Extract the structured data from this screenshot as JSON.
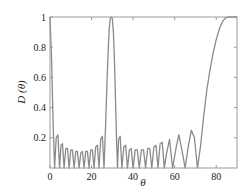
{
  "chart_data": {
    "type": "line",
    "title": "",
    "xlabel": "θ",
    "ylabel": "D (θ)",
    "xlim": [
      0,
      90
    ],
    "ylim": [
      0,
      1
    ],
    "x_ticks": [
      0,
      20,
      40,
      60,
      80
    ],
    "y_ticks": [
      0.2,
      0.4,
      0.6,
      0.8,
      1
    ],
    "y_tick_labels": [
      "0.2",
      "0.4",
      "0.6",
      "0.8",
      "1"
    ],
    "x_tick_labels": [
      "0",
      "20",
      "40",
      "60",
      "80"
    ],
    "grid": false,
    "legend": null,
    "line_color": "#8a8a8a",
    "series": [
      {
        "name": "D(θ)",
        "x": [
          0,
          0.8,
          1.5,
          2.2,
          3.0,
          3.8,
          4.6,
          5.3,
          6.0,
          6.8,
          7.6,
          8.4,
          9.2,
          10.0,
          10.8,
          11.6,
          12.4,
          13.2,
          14.0,
          14.8,
          15.6,
          16.4,
          17.2,
          18.0,
          18.8,
          19.6,
          20.4,
          21.2,
          22.0,
          22.8,
          23.6,
          24.4,
          25.2,
          26.0,
          26.8,
          27.4,
          28.0,
          28.5,
          29.0,
          29.5,
          30.0,
          30.5,
          31.0,
          31.5,
          32.0,
          32.5,
          33.0,
          33.8,
          34.6,
          35.5,
          36.4,
          37.3,
          38.2,
          39.1,
          40.0,
          41.0,
          42.0,
          43.0,
          44.0,
          45.0,
          46.0,
          47.0,
          48.0,
          49.0,
          50.0,
          51.0,
          52.0,
          53.0,
          54.0,
          55.0,
          56.0,
          57.5,
          59.0,
          60.5,
          62.0,
          63.5,
          65.0,
          66.5,
          68.0,
          69.5,
          71.0,
          72.5,
          74.0,
          75.5,
          77.0,
          78.5,
          80.0,
          81.5,
          83.0,
          84.5,
          86.0,
          88.0,
          90.0
        ],
        "y": [
          1.0,
          0.7,
          0.3,
          0.0,
          0.2,
          0.22,
          0.0,
          0.15,
          0.16,
          0.0,
          0.13,
          0.13,
          0.0,
          0.12,
          0.12,
          0.0,
          0.11,
          0.11,
          0.0,
          0.1,
          0.11,
          0.0,
          0.11,
          0.11,
          0.0,
          0.12,
          0.12,
          0.0,
          0.14,
          0.15,
          0.0,
          0.19,
          0.21,
          0.0,
          0.3,
          0.55,
          0.78,
          0.92,
          0.99,
          1.0,
          0.99,
          0.9,
          0.72,
          0.45,
          0.2,
          0.0,
          0.19,
          0.21,
          0.0,
          0.14,
          0.15,
          0.0,
          0.12,
          0.13,
          0.0,
          0.12,
          0.12,
          0.0,
          0.12,
          0.12,
          0.0,
          0.13,
          0.13,
          0.0,
          0.14,
          0.15,
          0.0,
          0.16,
          0.17,
          0.0,
          0.09,
          0.19,
          0.0,
          0.12,
          0.22,
          0.12,
          0.0,
          0.14,
          0.25,
          0.2,
          0.0,
          0.15,
          0.35,
          0.52,
          0.65,
          0.76,
          0.85,
          0.92,
          0.97,
          0.995,
          1.0,
          1.0,
          1.0
        ]
      }
    ]
  }
}
